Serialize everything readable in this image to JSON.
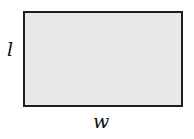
{
  "diagram": {
    "shape": "rectangle",
    "fill_color": "#e9e9e9",
    "border_color": "#1e1e1e",
    "labels": {
      "length": "l",
      "width": "w"
    }
  }
}
